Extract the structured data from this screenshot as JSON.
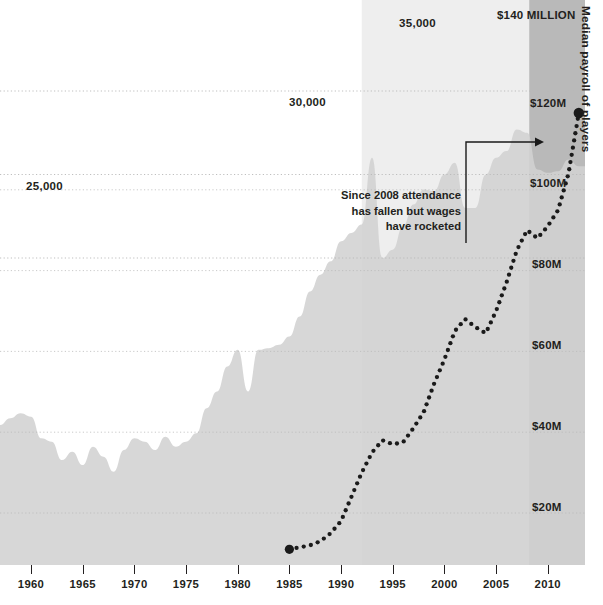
{
  "intro": {
    "lines": [
      "Forbes, there are now 14 out of 24 regional TV markets in",
      "the US where local ratings for MLB games now have a larger",
      "audience than the nationally televised games. Baseball is",
      "becoming more tribal."
    ]
  },
  "annotation": {
    "lines": [
      "Since 2008 attendance",
      "has fallen but wages",
      "have rocketed"
    ]
  },
  "axes": {
    "right_title": "Median payroll of players",
    "left_ticks": [
      "25,000",
      "30,000",
      "35,000"
    ],
    "right_ticks": [
      "$20M",
      "$40M",
      "$60M",
      "$80M",
      "$100M",
      "$120M",
      "$140 MILLION"
    ],
    "x_ticks": [
      "1960",
      "1965",
      "1970",
      "1975",
      "1980",
      "1985",
      "1990",
      "1995",
      "2000",
      "2005",
      "2010"
    ]
  },
  "colors": {
    "area_fill": "#d2d2d2",
    "shaded_band": "#b5b5b5",
    "band_light": "#e2e2e2",
    "dots": "#1a1a1a",
    "gridline": "#b9b9b9",
    "text": "#231f20",
    "intro_text": "#4a4a4a"
  },
  "chart_data": {
    "type": "area",
    "title": "",
    "xlabel": "",
    "ylabel": "Average attendance per game",
    "y2label": "Median payroll of players",
    "xlim": [
      1957,
      2013
    ],
    "ylim": [
      0,
      37500
    ],
    "y2lim": [
      0,
      148000000
    ],
    "grid": true,
    "legend": "none",
    "series": [
      {
        "name": "Average attendance per game",
        "type": "area",
        "axis": "left",
        "unit": "spectators",
        "x": [
          1957,
          1958,
          1959,
          1960,
          1961,
          1962,
          1963,
          1964,
          1965,
          1966,
          1967,
          1968,
          1969,
          1970,
          1971,
          1972,
          1973,
          1974,
          1975,
          1976,
          1977,
          1978,
          1979,
          1980,
          1981,
          1982,
          1983,
          1984,
          1985,
          1986,
          1987,
          1988,
          1989,
          1990,
          1991,
          1992,
          1993,
          1994,
          1995,
          1996,
          1997,
          1998,
          1999,
          2000,
          2001,
          2002,
          2003,
          2004,
          2005,
          2006,
          2007,
          2008,
          2009,
          2010,
          2011,
          2012,
          2013
        ],
        "values": [
          15000,
          15400,
          15700,
          15500,
          14200,
          14000,
          12900,
          13400,
          12600,
          13700,
          13100,
          12200,
          13500,
          14200,
          14000,
          13500,
          14300,
          13700,
          14000,
          14500,
          16000,
          17000,
          18500,
          19500,
          17000,
          19500,
          19600,
          19800,
          20300,
          21500,
          23000,
          24000,
          24800,
          26000,
          26500,
          27000,
          31000,
          25000,
          25500,
          26900,
          28200,
          29100,
          29000,
          30000,
          30700,
          28000,
          28000,
          30000,
          31000,
          31400,
          32700,
          32500,
          30300,
          30100,
          30200,
          30900,
          30500
        ],
        "notes": "Sharp 1993 expansion spike to ~31,000 then 1994-95 strike collapse to ~25,000; peak ~32,700 in 2007; decline after 2008"
      },
      {
        "name": "Median payroll of players",
        "type": "line-dotted",
        "axis": "right",
        "unit": "USD",
        "x": [
          1985,
          1986,
          1987,
          1988,
          1989,
          1990,
          1991,
          1992,
          1993,
          1994,
          1995,
          1996,
          1997,
          1998,
          1999,
          2000,
          2001,
          2002,
          2003,
          2004,
          2005,
          2006,
          2007,
          2008,
          2009,
          2010,
          2011,
          2012,
          2013
        ],
        "values": [
          11000000,
          11500000,
          12000000,
          13000000,
          15000000,
          18000000,
          24000000,
          30000000,
          35000000,
          38000000,
          37000000,
          37500000,
          41000000,
          45000000,
          52000000,
          58000000,
          65000000,
          68000000,
          66000000,
          64500000,
          70000000,
          77000000,
          85000000,
          90000000,
          88000000,
          91000000,
          95000000,
          104000000,
          119000000
        ],
        "notes": "Dotted marker series; terminal large dot at ~$119M in 2013"
      }
    ],
    "annotations": [
      {
        "text": "Since 2008 attendance has fallen but wages have rocketed",
        "arrow_from_year": 2008,
        "arrow_to_year": 2012
      }
    ],
    "shaded_region": {
      "from_year": 2008,
      "to_year": 2013,
      "meaning": "post-2008 period highlighted"
    }
  }
}
